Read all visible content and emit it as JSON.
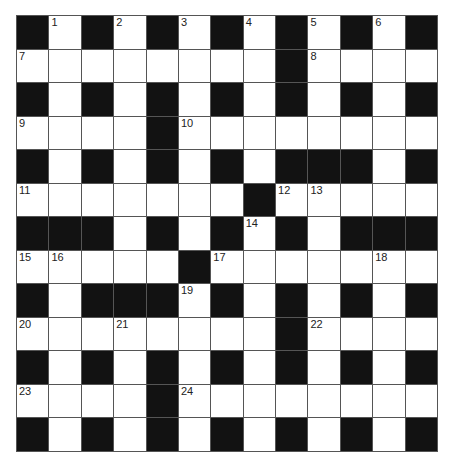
{
  "puzzle": {
    "rows": 13,
    "cols": 13,
    "colors": {
      "block": "#121212",
      "cell": "#ffffff",
      "line": "#555555"
    },
    "layout": [
      "#.#.#.#.#.#.#",
      "........#....",
      "#.#.#.#.#.#.#",
      "....#........",
      "#.#.#.#.###.#",
      ".......#.....",
      "###.#.#.#.###",
      ".....#.......",
      "#.###.#.#.#.#",
      "........#....",
      "#.#.#.#.#.#.#",
      "....#........",
      "#.#.#.#.#.#.#"
    ],
    "numbers": [
      {
        "r": 0,
        "c": 1,
        "n": "1"
      },
      {
        "r": 0,
        "c": 3,
        "n": "2"
      },
      {
        "r": 0,
        "c": 5,
        "n": "3"
      },
      {
        "r": 0,
        "c": 7,
        "n": "4"
      },
      {
        "r": 0,
        "c": 9,
        "n": "5"
      },
      {
        "r": 0,
        "c": 11,
        "n": "6"
      },
      {
        "r": 1,
        "c": 0,
        "n": "7"
      },
      {
        "r": 1,
        "c": 9,
        "n": "8"
      },
      {
        "r": 3,
        "c": 0,
        "n": "9"
      },
      {
        "r": 3,
        "c": 5,
        "n": "10"
      },
      {
        "r": 5,
        "c": 0,
        "n": "11"
      },
      {
        "r": 5,
        "c": 8,
        "n": "12"
      },
      {
        "r": 5,
        "c": 9,
        "n": "13"
      },
      {
        "r": 6,
        "c": 7,
        "n": "14"
      },
      {
        "r": 7,
        "c": 0,
        "n": "15"
      },
      {
        "r": 7,
        "c": 1,
        "n": "16"
      },
      {
        "r": 7,
        "c": 6,
        "n": "17"
      },
      {
        "r": 7,
        "c": 11,
        "n": "18"
      },
      {
        "r": 8,
        "c": 5,
        "n": "19"
      },
      {
        "r": 9,
        "c": 0,
        "n": "20"
      },
      {
        "r": 9,
        "c": 3,
        "n": "21"
      },
      {
        "r": 9,
        "c": 9,
        "n": "22"
      },
      {
        "r": 11,
        "c": 0,
        "n": "23"
      },
      {
        "r": 11,
        "c": 5,
        "n": "24"
      }
    ]
  }
}
